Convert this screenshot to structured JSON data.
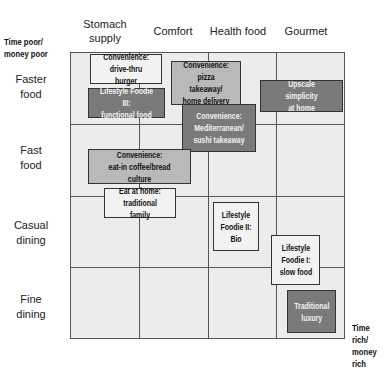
{
  "corners": {
    "top_left": "Time poor/\nmoney poor",
    "bottom_right": "Time rich/\nmoney rich"
  },
  "columns": [
    "Stomach supply",
    "Comfort",
    "Health food",
    "Gourmet"
  ],
  "rows": [
    "Faster food",
    "Fast food",
    "Casual dining",
    "Fine dining"
  ],
  "boxes": [
    {
      "label": "Convenience: drive-thru burger",
      "line1": "Convenience:",
      "line2": "drive-thru burger",
      "shade": "light"
    },
    {
      "label": "Lifestyle Foodie III: functional food",
      "line1": "Lifestyle Foodie III:",
      "line2": "functional food",
      "shade": "dark"
    },
    {
      "label": "Convenience: pizza takeaway/ home delivery",
      "line1": "Convenience:",
      "line2": "pizza takeaway/",
      "line3": "home delivery",
      "shade": "mid"
    },
    {
      "label": "Convenience: Mediterranean/ sushi takeaway",
      "line1": "Convenience:",
      "line2": "Mediterranean/",
      "line3": "sushi takeaway",
      "shade": "dark"
    },
    {
      "label": "Upscale simplicity at home",
      "line1": "Upscale simplicity",
      "line2": "at home",
      "shade": "dark"
    },
    {
      "label": "Convenience: eat-in coffee/bread culture",
      "line1": "Convenience:",
      "line2": "eat-in coffee/bread culture",
      "shade": "mid"
    },
    {
      "label": "Eat at home: traditional family",
      "line1": "Eat at home:",
      "line2": "traditional family",
      "shade": "light"
    },
    {
      "label": "Lifestyle Foodie II: Bio",
      "line1": "Lifestyle",
      "line2": "Foodie II:",
      "line3": "Bio",
      "shade": "light"
    },
    {
      "label": "Lifestyle Foodie I: slow food",
      "line1": "Lifestyle",
      "line2": "Foodie I:",
      "line3": "slow food",
      "shade": "light"
    },
    {
      "label": "Traditional luxury",
      "line1": "Traditional",
      "line2": "luxury",
      "shade": "dark"
    }
  ],
  "colors": {
    "grid_bg": "#ececec",
    "light_box": "#f2f2f2",
    "mid_box": "#b9b9b9",
    "dark_box": "#7a7a7a",
    "line": "#555555"
  }
}
